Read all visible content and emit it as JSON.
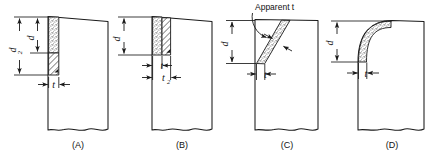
{
  "figure": {
    "background": "#ffffff",
    "line_color": "#1a1a1a",
    "fill_color": "#ffffff",
    "stipple_color": "#4a4a4a",
    "hatch_color": "#1a1a1a"
  },
  "panels": [
    {
      "id": "A",
      "label": "(A)",
      "dimensions": [
        {
          "name": "depth-total",
          "symbol": "d",
          "subscript": "2",
          "orientation": "vertical"
        },
        {
          "name": "depth-inner",
          "symbol": "d",
          "subscript": "",
          "orientation": "vertical"
        },
        {
          "name": "thickness",
          "symbol": "t",
          "subscript": "",
          "orientation": "horizontal"
        }
      ],
      "fills": [
        {
          "name": "stipple-band",
          "pattern": "stipple"
        },
        {
          "name": "hatch-band",
          "pattern": "diagonal-hatch"
        }
      ]
    },
    {
      "id": "B",
      "label": "(B)",
      "dimensions": [
        {
          "name": "depth",
          "symbol": "d",
          "subscript": "",
          "orientation": "vertical"
        },
        {
          "name": "thickness-inner",
          "symbol": "t",
          "subscript": "",
          "orientation": "horizontal"
        },
        {
          "name": "thickness-total",
          "symbol": "t",
          "subscript": "2",
          "orientation": "horizontal"
        }
      ],
      "fills": [
        {
          "name": "stipple-band",
          "pattern": "stipple"
        },
        {
          "name": "hatch-band",
          "pattern": "diagonal-hatch"
        }
      ]
    },
    {
      "id": "C",
      "label": "(C)",
      "annotation": "Apparent t",
      "dimensions": [
        {
          "name": "depth",
          "symbol": "d",
          "subscript": "",
          "orientation": "vertical"
        },
        {
          "name": "thickness",
          "symbol": "t",
          "subscript": "",
          "orientation": "horizontal"
        }
      ],
      "fills": [
        {
          "name": "slanted-stipple-band",
          "pattern": "stipple"
        }
      ]
    },
    {
      "id": "D",
      "label": "(D)",
      "dimensions": [
        {
          "name": "depth",
          "symbol": "d",
          "subscript": "",
          "orientation": "vertical"
        },
        {
          "name": "thickness",
          "symbol": "t",
          "subscript": "",
          "orientation": "horizontal"
        }
      ],
      "fills": [
        {
          "name": "curved-stipple-band",
          "pattern": "stipple"
        }
      ]
    }
  ]
}
